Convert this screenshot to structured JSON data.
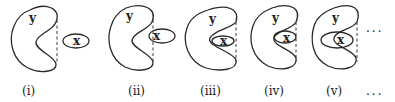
{
  "figure": {
    "panels": [
      {
        "id": "i",
        "caption": "(i)",
        "outer_label": "y",
        "inner_label": "x",
        "relation": "disjoint"
      },
      {
        "id": "ii",
        "caption": "(ii)",
        "outer_label": "y",
        "inner_label": "x",
        "relation": "partially overlapping boundary"
      },
      {
        "id": "iii",
        "caption": "(iii)",
        "outer_label": "y",
        "inner_label": "x",
        "relation": "inside concavity"
      },
      {
        "id": "iv",
        "caption": "(iv)",
        "outer_label": "y",
        "inner_label": "x",
        "relation": "overlapping inner edge"
      },
      {
        "id": "v",
        "caption": "(v)",
        "outer_label": "y",
        "inner_label": "x",
        "relation": "overlapping further"
      }
    ],
    "continuation_top": "...",
    "continuation_bottom": "..."
  }
}
